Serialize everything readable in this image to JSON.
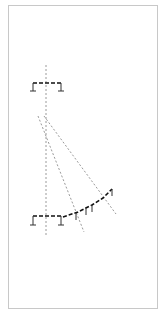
{
  "diagram": {
    "type": "structural-line-drawing",
    "frame": {
      "x": 8,
      "y": 5,
      "width": 150,
      "height": 304,
      "stroke": "#c8c8c8"
    },
    "colors": {
      "beam": "#111111",
      "support": "#333333",
      "guide": "#9a9a9a"
    },
    "axis_line": {
      "x": 46,
      "y1": 65,
      "y2": 237
    },
    "top_beam": {
      "x1": 33,
      "x2": 61,
      "y": 83,
      "leg_bottom": 91
    },
    "bottom_beam": {
      "x1": 33,
      "x2": 61,
      "y": 216,
      "leg_bottom": 225
    },
    "curved_beam": {
      "points": [
        [
          63,
          217
        ],
        [
          78,
          212
        ],
        [
          92,
          205
        ],
        [
          103,
          198
        ],
        [
          112,
          189
        ]
      ],
      "ticks": [
        [
          76,
          213
        ],
        [
          86,
          208
        ],
        [
          92,
          205
        ],
        [
          112,
          189
        ]
      ]
    },
    "diagonals": [
      {
        "x1": 38,
        "y1": 116,
        "x2": 84,
        "y2": 232
      },
      {
        "x1": 44,
        "y1": 116,
        "x2": 116,
        "y2": 214
      }
    ]
  }
}
